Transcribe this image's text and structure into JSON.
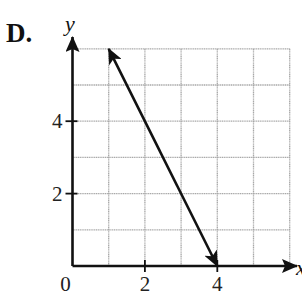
{
  "option_label": "D.",
  "chart_data": {
    "type": "line",
    "title": "",
    "xlabel": "x",
    "ylabel": "y",
    "xlim": [
      0,
      6
    ],
    "ylim": [
      0,
      6
    ],
    "grid": true,
    "x_ticks": [
      {
        "value": 0,
        "label": "0"
      },
      {
        "value": 2,
        "label": "2"
      },
      {
        "value": 4,
        "label": "4"
      }
    ],
    "y_ticks": [
      {
        "value": 2,
        "label": "2"
      },
      {
        "value": 4,
        "label": "4"
      }
    ],
    "series": [
      {
        "name": "line",
        "equation": "y = -2x + 8",
        "x": [
          1,
          4
        ],
        "y": [
          6,
          0
        ],
        "arrows_both_ends": true
      }
    ],
    "colors": {
      "grid": "#a8a8a8",
      "axis": "#111111",
      "line": "#111111"
    }
  }
}
